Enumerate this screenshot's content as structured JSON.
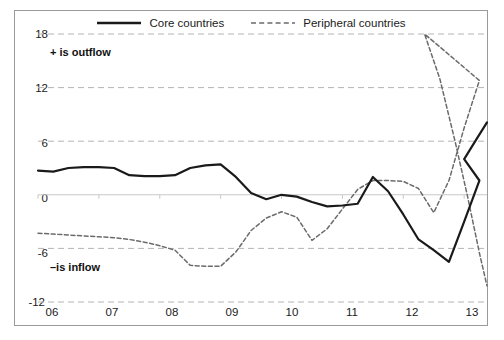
{
  "chart_data": {
    "type": "line",
    "title": "",
    "subtitle": "",
    "xlabel": "",
    "ylabel": "",
    "xlim": [
      2006.0,
      2013.375
    ],
    "ylim": [
      -12,
      18
    ],
    "yticks": [
      18,
      12,
      6,
      0,
      -6,
      -12
    ],
    "xticks": [
      2006,
      2007,
      2008,
      2009,
      2010,
      2011,
      2012,
      2013
    ],
    "xtick_labels": [
      "06",
      "07",
      "08",
      "09",
      "10",
      "11",
      "12",
      "13"
    ],
    "ytick_labels": [
      "18",
      "12",
      "6",
      "0",
      "-6",
      "-12"
    ],
    "grid": "horizontal-dashed",
    "legend_position": "top-center",
    "annotations": [
      {
        "text": "+ is outflow",
        "x": 2006.15,
        "y": 15.2,
        "bold": true
      },
      {
        "text": "–is inflow",
        "x": 2006.15,
        "y": -6.9,
        "bold": true
      }
    ],
    "x": [
      2006.0,
      2006.25,
      2006.5,
      2006.75,
      2007.0,
      2007.25,
      2007.5,
      2007.75,
      2008.0,
      2008.25,
      2008.5,
      2008.75,
      2009.0,
      2009.25,
      2009.5,
      2009.75,
      2010.0,
      2010.25,
      2010.5,
      2010.75,
      2011.0,
      2011.25,
      2011.5,
      2011.75,
      2012.0,
      2012.25,
      2012.5,
      2012.75,
      2013.0,
      2013.25
    ],
    "series": [
      {
        "name": "Core countries",
        "style": "solid",
        "color": "#1a1a1a",
        "values": [
          2.7,
          2.6,
          3.0,
          3.1,
          3.1,
          3.0,
          2.2,
          2.1,
          2.1,
          2.2,
          3.0,
          3.3,
          3.4,
          2.0,
          0.2,
          -0.5,
          0.0,
          -0.2,
          -0.8,
          -1.3,
          -1.2,
          -1.0,
          2.0,
          0.4,
          -2.2,
          -5.0,
          -6.2,
          -7.5,
          -3.0,
          1.6
        ]
      },
      {
        "name": "Peripheral countries",
        "style": "dashed",
        "color": "#6b6b6b",
        "values": [
          -4.3,
          -4.4,
          -4.5,
          -4.6,
          -4.7,
          -4.8,
          -5.0,
          -5.3,
          -5.7,
          -6.2,
          -7.9,
          -8.0,
          -8.0,
          -6.4,
          -4.0,
          -2.6,
          -1.9,
          -2.5,
          -5.1,
          -3.8,
          -1.6,
          0.6,
          1.6,
          1.6,
          1.5,
          0.7,
          -2.0,
          1.6,
          7.5,
          12.8
        ]
      }
    ],
    "series_extra": [
      {
        "name": "Core countries",
        "tail_values": [
          4.0,
          6.2,
          8.1
        ],
        "tail_x": [
          2013.0,
          2013.2,
          2013.375
        ]
      },
      {
        "name": "Peripheral countries",
        "tail_values": [
          18.0,
          13.0,
          6.0,
          0.0,
          -6.5,
          -10.2
        ],
        "tail_x": [
          2012.35,
          2012.6,
          2012.85,
          2013.05,
          2013.25,
          2013.375
        ]
      }
    ]
  },
  "legend": {
    "items": [
      {
        "label": "Core countries",
        "style": "solid",
        "color": "#1a1a1a"
      },
      {
        "label": "Peripheral countries",
        "style": "dashed",
        "color": "#6b6b6b"
      }
    ]
  },
  "axes": {
    "y_labels": [
      "18",
      "12",
      "6",
      "0",
      "-6",
      "-12"
    ],
    "x_labels": [
      "06",
      "07",
      "08",
      "09",
      "10",
      "11",
      "12",
      "13"
    ]
  },
  "notes": {
    "outflow": "+ is outflow",
    "inflow": "–is inflow"
  },
  "colors": {
    "core": "#1a1a1a",
    "peripheral": "#6b6b6b",
    "grid": "#b4b4b4",
    "zero_line": "#c8c8c8",
    "frame": "#9a9a9a",
    "background": "#ffffff",
    "text": "#1a1a1a"
  }
}
